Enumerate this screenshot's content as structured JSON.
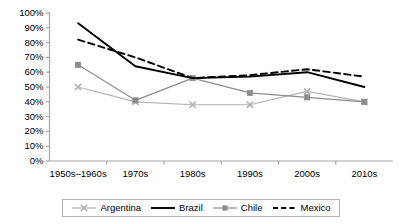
{
  "chart_data": {
    "type": "line",
    "title": "",
    "xlabel": "",
    "ylabel": "",
    "ylim": [
      0,
      100
    ],
    "yunit": "%",
    "grid": false,
    "legend_position": "bottom",
    "categories": [
      "1950s–1960s",
      "1970s",
      "1980s",
      "1990s",
      "2000s",
      "2010s"
    ],
    "ytick_labels": [
      "100%",
      "90%",
      "80%",
      "70%",
      "60%",
      "50%",
      "40%",
      "30%",
      "20%",
      "10%",
      "0%"
    ],
    "ytick_values": [
      100,
      90,
      80,
      70,
      60,
      50,
      40,
      30,
      20,
      10,
      0
    ],
    "series": [
      {
        "name": "Argentina",
        "color": "#b3b3b3",
        "marker": "x",
        "dash": "solid",
        "values": [
          50,
          40,
          38,
          38,
          47,
          40
        ]
      },
      {
        "name": "Brazil",
        "color": "#000000",
        "marker": "none",
        "dash": "solid",
        "values": [
          93,
          64,
          56,
          57,
          60,
          50
        ]
      },
      {
        "name": "Chile",
        "color": "#8c8c8c",
        "marker": "square",
        "dash": "solid",
        "values": [
          65,
          41,
          56,
          46,
          43,
          40
        ]
      },
      {
        "name": "Mexico",
        "color": "#000000",
        "marker": "none",
        "dash": "dashed",
        "values": [
          82,
          70,
          56,
          58,
          62,
          57
        ]
      }
    ]
  },
  "axis": {
    "axis_color": "#a6a6a6"
  }
}
